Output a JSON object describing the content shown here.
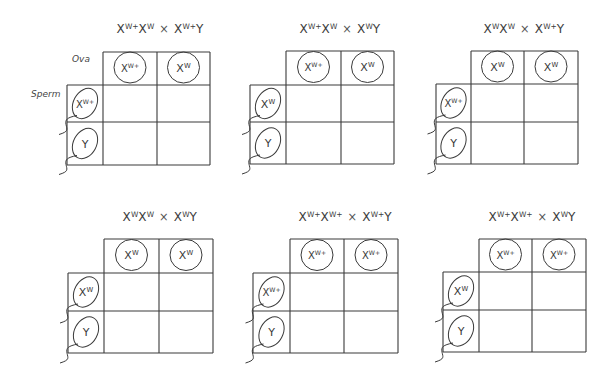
{
  "labels": {
    "ova": "Ova",
    "sperm": "Sperm"
  },
  "panels": [
    {
      "cross": {
        "mother": [
          [
            "X",
            "W+"
          ],
          [
            "X",
            "W"
          ]
        ],
        "father": [
          [
            "X",
            "W+"
          ],
          [
            "Y",
            ""
          ]
        ]
      },
      "ova": [
        [
          "X",
          "W+"
        ],
        [
          "X",
          "W"
        ]
      ],
      "sperm": [
        [
          "X",
          "W+"
        ],
        [
          "Y",
          ""
        ]
      ],
      "show_labels": true
    },
    {
      "cross": {
        "mother": [
          [
            "X",
            "W+"
          ],
          [
            "X",
            "W"
          ]
        ],
        "father": [
          [
            "X",
            "W"
          ],
          [
            "Y",
            ""
          ]
        ]
      },
      "ova": [
        [
          "X",
          "W+"
        ],
        [
          "X",
          "W"
        ]
      ],
      "sperm": [
        [
          "X",
          "W"
        ],
        [
          "Y",
          ""
        ]
      ],
      "show_labels": false
    },
    {
      "cross": {
        "mother": [
          [
            "X",
            "W"
          ],
          [
            "X",
            "W"
          ]
        ],
        "father": [
          [
            "X",
            "W+"
          ],
          [
            "Y",
            ""
          ]
        ]
      },
      "ova": [
        [
          "X",
          "W"
        ],
        [
          "X",
          "W"
        ]
      ],
      "sperm": [
        [
          "X",
          "W+"
        ],
        [
          "Y",
          ""
        ]
      ],
      "show_labels": false
    },
    {
      "cross": {
        "mother": [
          [
            "X",
            "W"
          ],
          [
            "X",
            "W"
          ]
        ],
        "father": [
          [
            "X",
            "W"
          ],
          [
            "Y",
            ""
          ]
        ]
      },
      "ova": [
        [
          "X",
          "W"
        ],
        [
          "X",
          "W"
        ]
      ],
      "sperm": [
        [
          "X",
          "W"
        ],
        [
          "Y",
          ""
        ]
      ],
      "show_labels": false
    },
    {
      "cross": {
        "mother": [
          [
            "X",
            "W+"
          ],
          [
            "X",
            "W+"
          ]
        ],
        "father": [
          [
            "X",
            "W+"
          ],
          [
            "Y",
            ""
          ]
        ]
      },
      "ova": [
        [
          "X",
          "W+"
        ],
        [
          "X",
          "W+"
        ]
      ],
      "sperm": [
        [
          "X",
          "W+"
        ],
        [
          "Y",
          ""
        ]
      ],
      "show_labels": false
    },
    {
      "cross": {
        "mother": [
          [
            "X",
            "W+"
          ],
          [
            "X",
            "W+"
          ]
        ],
        "father": [
          [
            "X",
            "W"
          ],
          [
            "Y",
            ""
          ]
        ]
      },
      "ova": [
        [
          "X",
          "W+"
        ],
        [
          "X",
          "W+"
        ]
      ],
      "sperm": [
        [
          "X",
          "W"
        ],
        [
          "Y",
          ""
        ]
      ],
      "show_labels": false
    }
  ],
  "times_symbol": "×",
  "offspring_cells": [
    [
      "",
      ""
    ],
    [
      "",
      ""
    ]
  ]
}
